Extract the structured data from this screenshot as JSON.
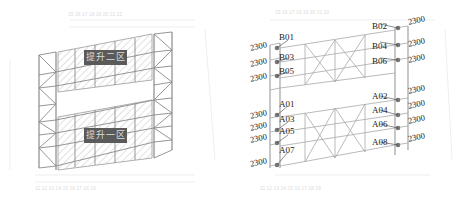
{
  "left_panel": {
    "zones": [
      {
        "label": "提升二区"
      },
      {
        "label": "提升一区"
      }
    ]
  },
  "right_panel": {
    "upper_tags_left": [
      "B01",
      "B03",
      "B05"
    ],
    "upper_tags_right": [
      "B02",
      "B04",
      "B06"
    ],
    "lower_tags_left": [
      "A01",
      "A03",
      "A05",
      "A07"
    ],
    "lower_tags_right": [
      "A02",
      "A04",
      "A06",
      "A08"
    ],
    "spacing_value": "2300"
  },
  "colors": {
    "frame": "#8a8a8a",
    "grid": "#d4d4d4",
    "label_bg": "#5a5a5a",
    "hatch": "#bdbdbd"
  }
}
